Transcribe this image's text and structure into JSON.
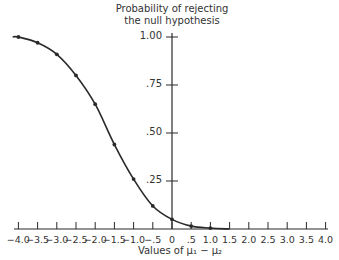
{
  "chart_data": {
    "type": "line",
    "title": "",
    "ylabel": "Probability of rejecting the null hypothesis",
    "ylabel_lines": [
      "Probability of rejecting",
      "the null hypothesis"
    ],
    "xlabel": "Values of μ₁ − μ₂",
    "xlim": [
      -4.0,
      4.0
    ],
    "ylim": [
      0,
      1.0
    ],
    "grid": false,
    "legend": null,
    "x_ticks": [
      "−4.0",
      "−3.5",
      "−3.0",
      "−2.5",
      "−2.0",
      "−1.5",
      "−1.0",
      "−.5",
      "0",
      ".5",
      "1.0",
      "1.5",
      "2.0",
      "2.5",
      "3.0",
      "3.5",
      "4.0"
    ],
    "y_ticks": [
      ".25",
      ".50",
      ".75",
      "1.00"
    ],
    "series": [
      {
        "name": "Power curve",
        "x": [
          -4.0,
          -3.5,
          -3.0,
          -2.5,
          -2.0,
          -1.5,
          -1.0,
          -0.5,
          0.0,
          0.5,
          1.0
        ],
        "values": [
          1.0,
          0.97,
          0.91,
          0.8,
          0.65,
          0.44,
          0.26,
          0.12,
          0.05,
          0.015,
          0.005
        ],
        "markers": true
      }
    ]
  }
}
